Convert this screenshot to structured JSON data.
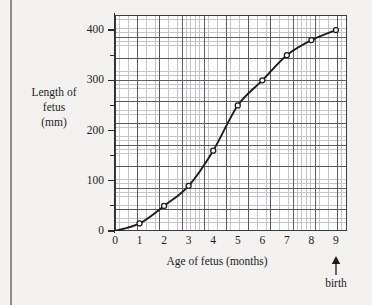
{
  "chart_data": {
    "type": "line",
    "title": "",
    "xlabel": "Age of fetus (months)",
    "ylabel": "Length of fetus (mm)",
    "ylabel_lines": [
      "Length of",
      "fetus",
      "(mm)"
    ],
    "x": [
      0,
      1,
      2,
      3,
      4,
      5,
      6,
      7,
      8,
      9
    ],
    "values": [
      0,
      15,
      50,
      90,
      160,
      250,
      300,
      350,
      380,
      400
    ],
    "series": [
      {
        "name": "Length of fetus",
        "values": [
          0,
          15,
          50,
          90,
          160,
          250,
          300,
          350,
          380,
          400
        ]
      }
    ],
    "xlim": [
      0,
      9.45
    ],
    "ylim": [
      0,
      430
    ],
    "xticks": [
      "0",
      "1",
      "2",
      "3",
      "4",
      "5",
      "6",
      "7",
      "8",
      "9"
    ],
    "yticks": [
      "0",
      "100",
      "200",
      "300",
      "400"
    ],
    "ytick_values": [
      0,
      100,
      200,
      300,
      400
    ],
    "yminor_values": [
      50,
      150,
      250,
      350
    ],
    "grid": true,
    "grid_style": "graph-paper, major every 1 month and 50 mm, minor 5 subdivisions",
    "legend": "none",
    "marker": "open-circle",
    "annotations": [
      {
        "label": "birth",
        "x": 9,
        "arrow": "up"
      }
    ],
    "colors": {
      "curve": "#1d1d1d",
      "grid_major": "#4a4d52",
      "grid_minor": "#b9bcc0",
      "axis": "#2b2b2b",
      "background": "#f3f2f0",
      "plot_background": "#ffffff"
    }
  }
}
